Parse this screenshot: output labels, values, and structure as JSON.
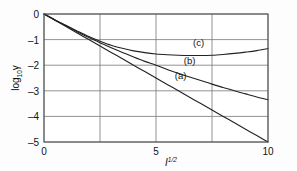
{
  "figure": {
    "background_color": "#fdfdfd",
    "frame_color": "#4c4c4c",
    "grid_color": "#777777",
    "curve_color": "#222222"
  },
  "axis": {
    "ylabel_main": "log",
    "ylabel_sub": "10",
    "ylabel_var": "γ",
    "xlabel_main": "I",
    "xlabel_sup": "1/2"
  },
  "labels": {
    "curve_a": "(a)",
    "curve_b": "(b)",
    "curve_c": "(c)"
  },
  "ticks": {
    "x": [
      "0",
      "5",
      "10"
    ],
    "y": [
      "0",
      "–1",
      "–2",
      "–3",
      "–4",
      "–5"
    ]
  },
  "chart_data": {
    "type": "line",
    "title": "",
    "xlabel": "I^1/2",
    "ylabel": "log10 gamma",
    "xlim": [
      0,
      10
    ],
    "ylim": [
      -5,
      0
    ],
    "xticks": [
      0,
      5,
      10
    ],
    "yticks": [
      0,
      -1,
      -2,
      -3,
      -4,
      -5
    ],
    "xgridlines": [
      0,
      2.5,
      5,
      7.5,
      10
    ],
    "ygridlines": [
      0,
      -1,
      -2,
      -3,
      -4,
      -5
    ],
    "grid": true,
    "legend": "inline-annotations",
    "annotations": [
      {
        "text": "(a)",
        "x": 6.1,
        "y": -2.55
      },
      {
        "text": "(b)",
        "x": 6.5,
        "y": -1.95
      },
      {
        "text": "(c)",
        "x": 6.9,
        "y": -1.25
      }
    ],
    "series": [
      {
        "name": "(a)",
        "x": [
          0,
          0.5,
          1,
          1.5,
          2,
          2.5,
          3,
          3.5,
          4,
          4.5,
          5,
          5.5,
          6,
          6.5,
          7,
          7.5,
          8,
          8.5,
          9,
          9.5,
          10
        ],
        "y": [
          0,
          -0.25,
          -0.5,
          -0.75,
          -1.0,
          -1.25,
          -1.5,
          -1.75,
          -2.0,
          -2.25,
          -2.5,
          -2.75,
          -3.0,
          -3.25,
          -3.5,
          -3.75,
          -4.0,
          -4.25,
          -4.5,
          -4.75,
          -5.0
        ]
      },
      {
        "name": "(b)",
        "x": [
          0,
          0.5,
          1,
          1.5,
          2,
          2.5,
          3,
          3.5,
          4,
          4.5,
          5,
          5.5,
          6,
          6.5,
          7,
          7.5,
          8,
          8.5,
          9,
          9.5,
          10
        ],
        "y": [
          0,
          -0.24,
          -0.47,
          -0.7,
          -0.92,
          -1.12,
          -1.32,
          -1.5,
          -1.68,
          -1.85,
          -2.0,
          -2.17,
          -2.32,
          -2.46,
          -2.6,
          -2.74,
          -2.87,
          -3.0,
          -3.12,
          -3.24,
          -3.35
        ]
      },
      {
        "name": "(c)",
        "x": [
          0,
          0.5,
          1,
          1.5,
          2,
          2.5,
          3,
          3.5,
          4,
          4.5,
          5,
          5.5,
          6,
          6.5,
          7,
          7.5,
          8,
          8.5,
          9,
          9.5,
          10
        ],
        "y": [
          0,
          -0.23,
          -0.45,
          -0.67,
          -0.88,
          -1.06,
          -1.22,
          -1.34,
          -1.44,
          -1.51,
          -1.56,
          -1.59,
          -1.61,
          -1.62,
          -1.62,
          -1.61,
          -1.58,
          -1.54,
          -1.49,
          -1.43,
          -1.35
        ]
      }
    ]
  }
}
